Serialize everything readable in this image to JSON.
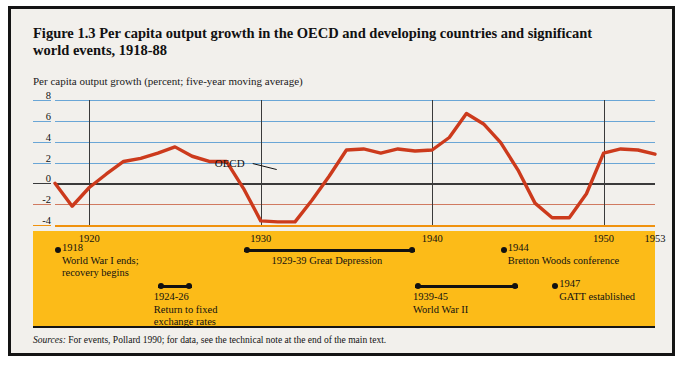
{
  "figure": {
    "title_line1": "Figure 1.3  Per capita output growth in the OECD and developing countries and significant",
    "title_line2": "world events, 1918-88",
    "subtitle": "Per capita output growth (percent; five-year moving average)",
    "source_label": "Sources:",
    "source_text": "For events, Pollard 1990; for data, see the technical note at the end of the main text.",
    "border_color": "#141414",
    "paper_color": "#f2f0ec",
    "band_color": "#fcbb18"
  },
  "chart_data": {
    "type": "line",
    "title": "Per capita output growth in the OECD and developing countries and significant world events, 1918-88",
    "xlabel": "",
    "ylabel": "Per capita output growth (percent; five-year moving average)",
    "xlim": [
      1918,
      1953
    ],
    "ylim": [
      -4,
      8
    ],
    "yticks": [
      8,
      6,
      4,
      2,
      0,
      -2,
      -4
    ],
    "xticks": [
      1920,
      1930,
      1940,
      1950,
      1953
    ],
    "grid": true,
    "grid_color_positive": "#6aa6d6",
    "grid_color_zero": "#3a3a3a",
    "grid_color_negative": "#d07a60",
    "grid_color_bottom": "#f0920e",
    "legend_position": "inline-annotation",
    "series": [
      {
        "name": "OECD",
        "color": "#cc3a1c",
        "line_width": 3.4,
        "x": [
          1918,
          1919,
          1920,
          1921,
          1922,
          1923,
          1924,
          1925,
          1926,
          1927,
          1928,
          1929,
          1930,
          1931,
          1932,
          1933,
          1934,
          1935,
          1936,
          1937,
          1938,
          1939,
          1940,
          1941,
          1942,
          1943,
          1944,
          1945,
          1946,
          1947,
          1948,
          1949,
          1950,
          1951,
          1952,
          1953
        ],
        "y": [
          0.0,
          -2.2,
          -0.4,
          0.9,
          2.1,
          2.4,
          2.9,
          3.5,
          2.6,
          2.1,
          2.1,
          -0.5,
          -3.6,
          -3.7,
          -3.7,
          -1.6,
          0.7,
          3.2,
          3.3,
          2.9,
          3.3,
          3.1,
          3.2,
          4.4,
          6.7,
          5.7,
          3.9,
          1.3,
          -1.9,
          -3.3,
          -3.3,
          -1.0,
          2.9,
          3.3,
          3.2,
          2.8
        ]
      }
    ],
    "annotations": [
      {
        "text": "OECD",
        "x": 1929.3,
        "y": 1.9,
        "leader": "line-to-series"
      }
    ]
  },
  "events": [
    {
      "id": "wwi-ends",
      "kind": "point",
      "year_label": "1918",
      "start": 1918,
      "end": 1918,
      "lines": [
        "1918",
        "World War I ends;",
        "recovery begins"
      ]
    },
    {
      "id": "return-fixed-rates",
      "kind": "span",
      "year_label": "1924-26",
      "start": 1924,
      "end": 1926,
      "lines": [
        "1924-26",
        "Return to fixed",
        "exchange rates"
      ]
    },
    {
      "id": "great-depression",
      "kind": "span",
      "year_label": "1929-39",
      "start": 1929,
      "end": 1939,
      "lines": [
        "1929-39 Great Depression"
      ]
    },
    {
      "id": "world-war-two",
      "kind": "span",
      "year_label": "1939-45",
      "start": 1939,
      "end": 1945,
      "lines": [
        "1939-45",
        "World War II"
      ]
    },
    {
      "id": "bretton-woods",
      "kind": "point",
      "year_label": "1944",
      "start": 1944,
      "end": 1944,
      "lines": [
        "1944",
        "Bretton Woods conference"
      ]
    },
    {
      "id": "gatt-established",
      "kind": "point",
      "year_label": "1947",
      "start": 1947,
      "end": 1947,
      "lines": [
        "1947",
        "GATT established"
      ]
    }
  ]
}
